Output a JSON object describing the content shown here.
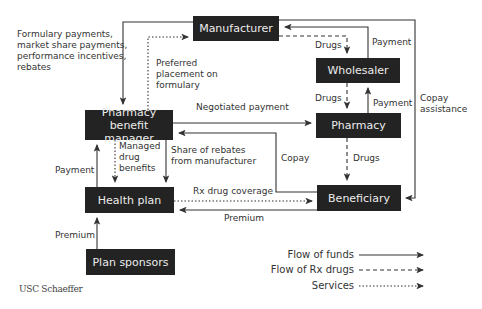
{
  "nodes": {
    "manufacturer": "Manufacturer",
    "wholesaler": "Wholesaler",
    "pharmacy": "Pharmacy",
    "pbm_line1": "Pharmacy benefit",
    "pbm_line2": "manager",
    "health_plan": "Health plan",
    "beneficiary": "Beneficiary",
    "plan_sponsors": "Plan sponsors"
  },
  "edge_labels": {
    "formulary_payments": [
      "Formulary payments,",
      "market share payments,",
      "performance incentives,",
      "rebates"
    ],
    "preferred_placement": [
      "Preferred",
      "placement on",
      "formulary"
    ],
    "drugs_mfr_wholesaler": "Drugs",
    "payment_wholesaler_mfr": "Payment",
    "drugs_wholesaler_pharmacy": "Drugs",
    "payment_pharmacy_wholesaler": "Payment",
    "copay_assistance": [
      "Copay",
      "assistance"
    ],
    "negotiated_payment": "Negotiated payment",
    "managed_drug_benefits": [
      "Managed",
      "drug",
      "benefits"
    ],
    "share_of_rebates": [
      "Share of rebates",
      "from manufacturer"
    ],
    "copay": "Copay",
    "drugs_pharmacy_beneficiary": "Drugs",
    "payment_hp_pbm": "Payment",
    "rx_drug_coverage": "Rx drug coverage",
    "premium_beneficiary_hp": "Premium",
    "premium_sponsors_hp": "Premium"
  },
  "legend": {
    "funds": "Flow of funds",
    "drugs": "Flow of Rx drugs",
    "services": "Services"
  },
  "credit": "USC Schaeffer",
  "colors": {
    "box": "#232323",
    "box_text": "#ececec",
    "line": "#333333"
  }
}
